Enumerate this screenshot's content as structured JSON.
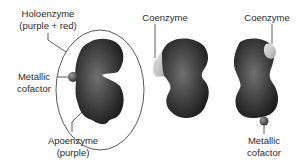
{
  "diagram": {
    "labels": {
      "holoenzyme_line1": "Holoenzyme",
      "holoenzyme_line2": "(purple + red)",
      "metallic_cofactor_left_line1": "Metallic",
      "metallic_cofactor_left_line2": "cofactor",
      "apoenzyme_line1": "Apoenzyme",
      "apoenzyme_line2": "(purple)",
      "coenzyme_middle": "Coenzyme",
      "coenzyme_right": "Coenzyme",
      "metallic_cofactor_right_line1": "Metallic",
      "metallic_cofactor_right_line2": "cofactor"
    },
    "colors": {
      "enzyme_body": "#3a3a3a",
      "enzyme_highlight": "#6e6e6e",
      "coenzyme": "#c8c8c8",
      "metal_cofactor": "#555555",
      "outline": "#333333"
    }
  }
}
